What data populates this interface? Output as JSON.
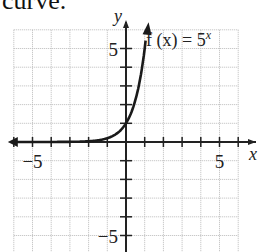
{
  "caption": "curve.",
  "chart_data": {
    "type": "line",
    "title": "",
    "function_label": "f(x) = 5^x",
    "function_label_base": "f (x) = 5",
    "function_label_exp": "x",
    "xlabel": "x",
    "ylabel": "y",
    "xlim": [
      -6,
      6
    ],
    "ylim": [
      -6,
      6
    ],
    "grid": true,
    "x_tick_labels": [
      "-5",
      "5"
    ],
    "y_tick_labels": [
      "5",
      "-5"
    ],
    "series": [
      {
        "name": "f(x) = 5^x",
        "x": [
          -6,
          -5,
          -4,
          -3,
          -2,
          -1,
          -0.5,
          0,
          0.5,
          1,
          1.1
        ],
        "y": [
          6e-05,
          0.0003,
          0.0016,
          0.008,
          0.04,
          0.2,
          0.447,
          1,
          2.236,
          5,
          5.87
        ]
      }
    ],
    "arrows": [
      "left end of curve",
      "top end of curve",
      "both axes"
    ]
  }
}
